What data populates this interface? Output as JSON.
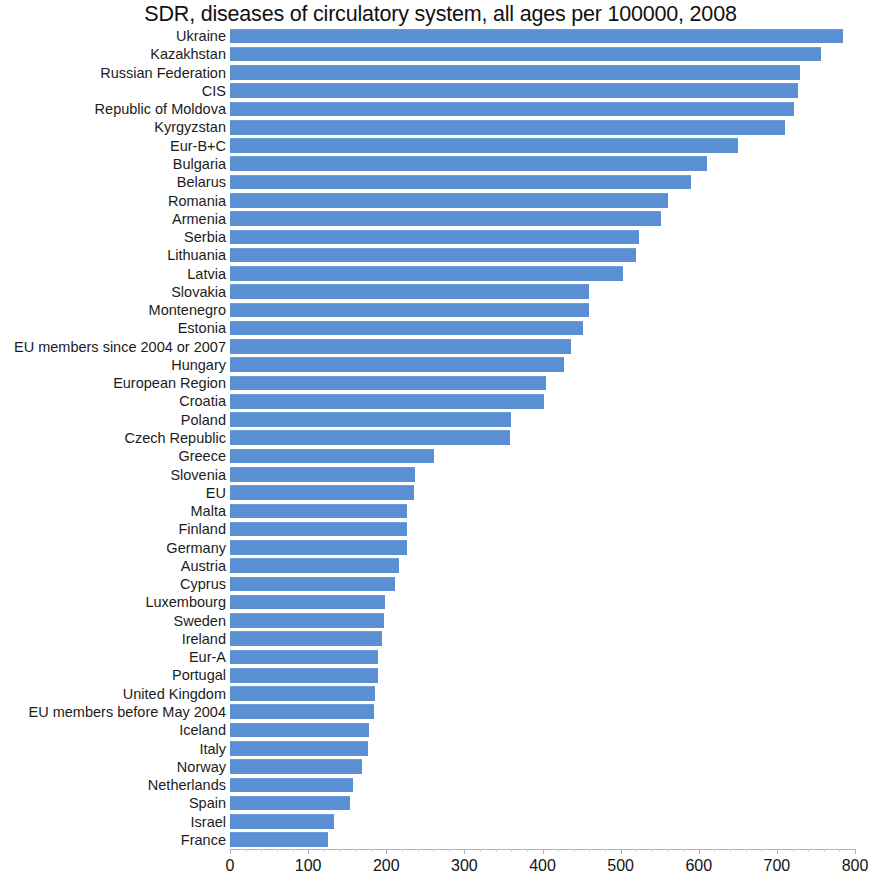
{
  "chart_data": {
    "type": "bar",
    "orientation": "horizontal",
    "title": "SDR, diseases of circulatory system, all ages per 100000, 2008",
    "xlabel": "",
    "ylabel": "",
    "xlim": [
      0,
      800
    ],
    "xticks": [
      0,
      100,
      200,
      300,
      400,
      500,
      600,
      700,
      800
    ],
    "xtick_labels": [
      "0",
      "100",
      "200",
      "300",
      "400",
      "500",
      "600",
      "700",
      "800"
    ],
    "grid": false,
    "legend": null,
    "bar_color": "#5b8fd4",
    "background_color": "#ffffff",
    "categories": [
      "Ukraine",
      "Kazakhstan",
      "Russian Federation",
      "CIS",
      "Republic of Moldova",
      "Kyrgyzstan",
      "Eur-B+C",
      "Bulgaria",
      "Belarus",
      "Romania",
      "Armenia",
      "Serbia",
      "Lithuania",
      "Latvia",
      "Slovakia",
      "Montenegro",
      "Estonia",
      "EU members since 2004 or 2007",
      "Hungary",
      "European Region",
      "Croatia",
      "Poland",
      "Czech Republic",
      "Greece",
      "Slovenia",
      "EU",
      "Malta",
      "Finland",
      "Germany",
      "Austria",
      "Cyprus",
      "Luxembourg",
      "Sweden",
      "Ireland",
      "Eur-A",
      "Portugal",
      "United Kingdom",
      "EU members before May 2004",
      "Iceland",
      "Italy",
      "Norway",
      "Netherlands",
      "Spain",
      "Israel",
      "France"
    ],
    "values": [
      785,
      756,
      730,
      727,
      722,
      711,
      650,
      611,
      590,
      561,
      552,
      524,
      520,
      503,
      459,
      459,
      452,
      437,
      427,
      405,
      402,
      360,
      358,
      261,
      237,
      236,
      227,
      227,
      227,
      216,
      211,
      199,
      197,
      195,
      190,
      190,
      186,
      184,
      178,
      176,
      169,
      157,
      154,
      133,
      125
    ]
  }
}
